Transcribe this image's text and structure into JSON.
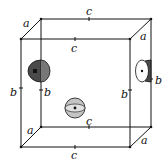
{
  "diagram": {
    "type": "unit-cell",
    "edge_labels": {
      "top_back_c": "c",
      "top_front_c": "c",
      "bottom_back_c": "c",
      "bottom_front_c": "c",
      "top_left_a": "a",
      "top_right_a": "a",
      "bottom_left_a": "a",
      "bottom_right_a": "a",
      "front_left_b": "b",
      "back_left_b": "b",
      "front_right_b": "b",
      "back_right_b": "b"
    },
    "atoms": [
      {
        "name": "left-face-half-sphere",
        "shape": "hemisphere",
        "fill": "#555555"
      },
      {
        "name": "right-face-half-sphere",
        "shape": "hemisphere",
        "fill": "#ffffff"
      },
      {
        "name": "body-center-sphere",
        "shape": "sphere",
        "fill": "#bbbbbb"
      }
    ],
    "colors": {
      "line": "#111111",
      "dark": "#4a4a4a",
      "light": "#c4c4c4"
    }
  }
}
